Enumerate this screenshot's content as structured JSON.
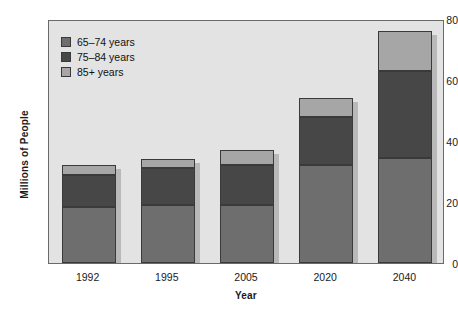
{
  "chart_data": {
    "type": "bar",
    "subtype": "stacked-vertical-bar",
    "title": "",
    "xlabel": "Year",
    "ylabel": "Millions of People",
    "categories": [
      "1992",
      "1995",
      "2005",
      "2020",
      "2040"
    ],
    "ylim": [
      0,
      80
    ],
    "yticks": [
      0,
      20,
      40,
      60,
      80
    ],
    "ytick_labels": [
      "0",
      "20",
      "40",
      "60",
      "80"
    ],
    "grid": false,
    "legend_position": "upper-left-inside",
    "series": [
      {
        "name": "65–74 years",
        "color": "#6e6e6e",
        "values": [
          18.5,
          19,
          19,
          32,
          34.5
        ]
      },
      {
        "name": "75–84 years",
        "color": "#474747",
        "values": [
          10.5,
          12,
          13,
          16,
          28.5
        ]
      },
      {
        "name": "85+ years",
        "color": "#a6a6a6",
        "values": [
          3,
          3,
          5,
          6,
          13
        ]
      }
    ],
    "totals": [
      32,
      34,
      37,
      54,
      76
    ],
    "plot_background": "#e3e3e3",
    "figure_background": "#ffffff",
    "axis_color": "#6a6a6a",
    "bar_edge_color": "#3a3a3a"
  }
}
